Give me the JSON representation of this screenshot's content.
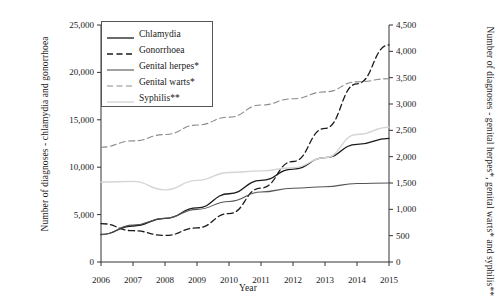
{
  "chart_data": {
    "type": "line",
    "title": "",
    "xlabel": "Year",
    "ylabel_left": "Number of diagnoses - chlamydia and gonorrhoea",
    "ylabel_right": "Number of diagnoses - genital herpes*, genital warts* and syphilis**",
    "x": [
      2006,
      2007,
      2008,
      2009,
      2010,
      2011,
      2012,
      2013,
      2014,
      2015
    ],
    "xtick_labels": [
      "2006",
      "2007",
      "2008",
      "2009",
      "2010",
      "2011",
      "2012",
      "2013",
      "2014",
      "2015"
    ],
    "ylim_left": [
      0,
      25000
    ],
    "ytick_labels_left": [
      "0",
      "5,000",
      "10,000",
      "15,000",
      "20,000",
      "25,000"
    ],
    "ytick_values_left": [
      0,
      5000,
      10000,
      15000,
      20000,
      25000
    ],
    "ylim_right": [
      0,
      4500
    ],
    "ytick_labels_right": [
      "0",
      "500",
      "1,000",
      "1,500",
      "2,000",
      "2,500",
      "3,000",
      "3,500",
      "4,000",
      "4,500"
    ],
    "ytick_values_right": [
      0,
      500,
      1000,
      1500,
      2000,
      2500,
      3000,
      3500,
      4000,
      4500
    ],
    "grid": false,
    "legend_position": "upper-left-inside",
    "series": [
      {
        "name": "Chlamydia",
        "axis": "left",
        "style": "solid",
        "color": "#1a1a1a",
        "width": 1.3,
        "values": [
          2900,
          3800,
          4600,
          5700,
          7200,
          8600,
          9800,
          11000,
          12400,
          13050
        ]
      },
      {
        "name": "Gonorrhoea",
        "axis": "left",
        "style": "dashed",
        "color": "#1a1a1a",
        "width": 1.3,
        "values": [
          4050,
          3300,
          2800,
          3600,
          5100,
          7800,
          10600,
          14100,
          18800,
          22900
        ]
      },
      {
        "name": "Genital herpes*",
        "axis": "right",
        "style": "solid",
        "color": "#555555",
        "width": 1.1,
        "values": [
          520,
          700,
          830,
          1000,
          1150,
          1330,
          1400,
          1430,
          1490,
          1500
        ]
      },
      {
        "name": "Genital warts*",
        "axis": "right",
        "style": "dashed",
        "color": "#8a8a8a",
        "width": 1.1,
        "values": [
          2180,
          2300,
          2420,
          2600,
          2750,
          2980,
          3100,
          3230,
          3420,
          3480
        ]
      },
      {
        "name": "Syphilis**",
        "axis": "right",
        "style": "solid",
        "color": "#d5d5d5",
        "width": 1.4,
        "values": [
          1520,
          1530,
          1370,
          1550,
          1700,
          1730,
          1790,
          1980,
          2420,
          2560
        ]
      }
    ]
  }
}
